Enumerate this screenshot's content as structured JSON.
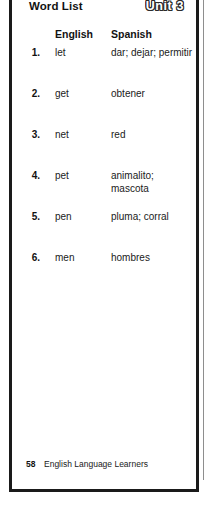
{
  "page": {
    "title": "Word List",
    "unit_badge": "Unit 3",
    "background_color": "#ffffff",
    "border_color": "#1a1a1a",
    "text_color": "#1a1a1a"
  },
  "columns": {
    "number_header": "",
    "english_header": "English",
    "spanish_header": "Spanish"
  },
  "words": [
    {
      "num": "1.",
      "english": "let",
      "spanish": "dar; dejar; permitir"
    },
    {
      "num": "2.",
      "english": "get",
      "spanish": "obtener"
    },
    {
      "num": "3.",
      "english": "net",
      "spanish": "red"
    },
    {
      "num": "4.",
      "english": "pet",
      "spanish": "animalito; mascota"
    },
    {
      "num": "5.",
      "english": "pen",
      "spanish": "pluma; corral"
    },
    {
      "num": "6.",
      "english": "men",
      "spanish": "hombres"
    }
  ],
  "footer": {
    "page_number": "58",
    "label": "English Language Learners"
  }
}
